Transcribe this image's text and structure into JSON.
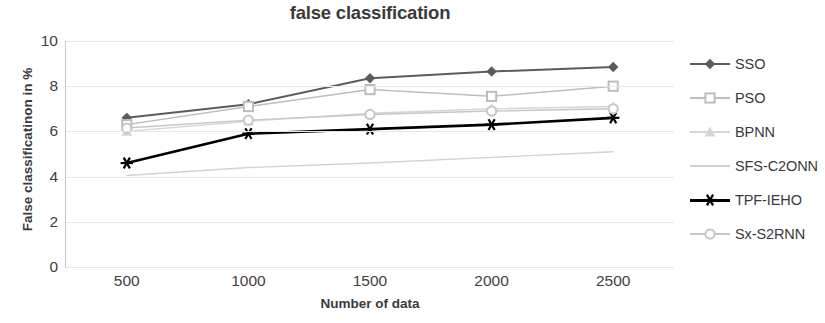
{
  "chart_data": {
    "type": "line",
    "title": "false classification",
    "xlabel": "Number of data",
    "ylabel": "False classificatinon in %",
    "categories": [
      "500",
      "1000",
      "1500",
      "2000",
      "2500"
    ],
    "x": [
      500,
      1000,
      1500,
      2000,
      2500
    ],
    "xlim": [
      250,
      2750
    ],
    "ylim": [
      0,
      10
    ],
    "yticks": [
      "0",
      "2",
      "4",
      "6",
      "8",
      "10"
    ],
    "ytick_values": [
      0,
      2,
      4,
      6,
      8,
      10
    ],
    "grid": true,
    "grid_axis": "y",
    "legend_position": "right",
    "series": [
      {
        "name": "SSO",
        "values": [
          6.6,
          7.2,
          8.35,
          8.65,
          8.85
        ],
        "color": "#5c5c5c",
        "marker": "diamond",
        "line_width": 2.0
      },
      {
        "name": "PSO",
        "values": [
          6.3,
          7.1,
          7.85,
          7.55,
          8.0
        ],
        "color": "#bdbdbd",
        "marker": "square",
        "line_width": 1.5
      },
      {
        "name": "BPNN",
        "values": [
          6.0,
          6.45,
          6.8,
          7.0,
          7.1
        ],
        "color": "#d6d6d6",
        "marker": "triangle",
        "line_width": 1.4
      },
      {
        "name": "SFS-C2ONN",
        "values": [
          4.05,
          4.4,
          4.6,
          4.85,
          5.1
        ],
        "color": "#d2d2d2",
        "marker": "none",
        "line_width": 1.4
      },
      {
        "name": "TPF-IEHO",
        "values": [
          4.6,
          5.9,
          6.1,
          6.3,
          6.6
        ],
        "color": "#000000",
        "marker": "star",
        "line_width": 2.6
      },
      {
        "name": "Sx-S2RNN",
        "values": [
          6.15,
          6.5,
          6.75,
          6.9,
          7.0
        ],
        "color": "#c6c6c6",
        "marker": "circle",
        "line_width": 1.4
      }
    ]
  }
}
